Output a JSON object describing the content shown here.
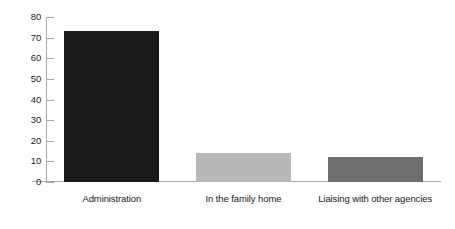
{
  "chart_data": {
    "type": "bar",
    "title": "",
    "subtitle": "",
    "xlabel": "",
    "ylabel": "",
    "categories": [
      "Administration",
      "In the family home",
      "Liaising with other agencies"
    ],
    "values": [
      73,
      14,
      12
    ],
    "ylim": [
      0,
      80
    ],
    "yticks": [
      0,
      10,
      20,
      30,
      40,
      50,
      60,
      70,
      80
    ],
    "ytick_labels": [
      "0",
      "10",
      "20",
      "30",
      "40",
      "50",
      "60",
      "70",
      "80"
    ],
    "grid": false,
    "legend": false,
    "legend_position": "none",
    "bar_colors": [
      "#1a1a1a",
      "#b8b8b8",
      "#6e6e6e"
    ],
    "axis_color": "#a8a8a8",
    "background_color": "#ffffff",
    "text_color": "#1a1a1a"
  }
}
